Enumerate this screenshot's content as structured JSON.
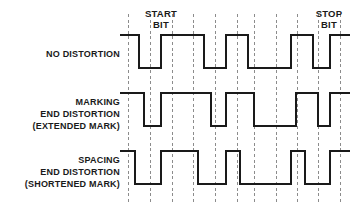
{
  "figure": {
    "background_color": "#ffffff",
    "trace_color": "#1a1a1a",
    "gridline_color": "#8c8c8c",
    "text_color": "#1a1a1a",
    "trace_width": 2.6,
    "width": 350,
    "height": 211
  },
  "annotations": {
    "start_bit": {
      "line1": "START",
      "line2": "BIT"
    },
    "stop_bit": {
      "line1": "STOP",
      "line2": "BIT"
    }
  },
  "rows": [
    {
      "id": "no-distortion",
      "labels": [
        "NO DISTORTION"
      ],
      "label_y": [
        57
      ]
    },
    {
      "id": "marking-end-distortion",
      "labels": [
        "MARKING",
        "END DISTORTION",
        "(EXTENDED MARK)"
      ],
      "label_y": [
        105,
        117,
        129
      ]
    },
    {
      "id": "spacing-end-distortion",
      "labels": [
        "SPACING",
        "END DISTORTION",
        "(SHORTENED MARK)"
      ],
      "label_y": [
        163,
        175,
        187
      ]
    }
  ],
  "chart_data": {
    "type": "line",
    "xlabel": "",
    "ylabel": "",
    "grid": true,
    "legend_position": "left",
    "x_axis": {
      "unit": "bit cell",
      "gridline_pixels": [
        128,
        150,
        172,
        193,
        215,
        237,
        254,
        276,
        297,
        318,
        340
      ],
      "plot_left_px": 128,
      "plot_right_px": 340,
      "bit_count": 10
    },
    "series": [
      {
        "name": "NO DISTORTION",
        "level_high_px": 35,
        "level_low_px": 68,
        "baseline_start_px": 120,
        "description": "Ideal waveform; all transitions fall exactly on bit boundaries.",
        "transitions_px": [
          {
            "x": 120,
            "level": "high"
          },
          {
            "x": 139,
            "level": "low"
          },
          {
            "x": 161,
            "level": "high"
          },
          {
            "x": 204,
            "level": "low"
          },
          {
            "x": 226,
            "level": "high"
          },
          {
            "x": 248,
            "level": "low"
          },
          {
            "x": 291,
            "level": "high"
          },
          {
            "x": 313,
            "level": "low"
          },
          {
            "x": 330,
            "level": "high"
          },
          {
            "x": 350,
            "level": "high"
          }
        ],
        "bits": [
          "1",
          "0",
          "1",
          "1",
          "0",
          "1",
          "0",
          "0",
          "1",
          "0",
          "1"
        ]
      },
      {
        "name": "MARKING END DISTORTION (EXTENDED MARK)",
        "level_high_px": 93,
        "level_low_px": 126,
        "baseline_start_px": 120,
        "description": "Mark (high) intervals are extended; falling edges occur late relative to the ideal bit boundary.",
        "transitions_px": [
          {
            "x": 120,
            "level": "high"
          },
          {
            "x": 144,
            "level": "low"
          },
          {
            "x": 161,
            "level": "high"
          },
          {
            "x": 211,
            "level": "low"
          },
          {
            "x": 226,
            "level": "high"
          },
          {
            "x": 254,
            "level": "low"
          },
          {
            "x": 296,
            "level": "high"
          },
          {
            "x": 318,
            "level": "low"
          },
          {
            "x": 330,
            "level": "high"
          },
          {
            "x": 350,
            "level": "high"
          }
        ]
      },
      {
        "name": "SPACING END DISTORTION (SHORTENED MARK)",
        "level_high_px": 151,
        "level_low_px": 184,
        "baseline_start_px": 120,
        "description": "Mark (high) intervals are shortened; falling edges occur early relative to the ideal bit boundary.",
        "transitions_px": [
          {
            "x": 120,
            "level": "high"
          },
          {
            "x": 135,
            "level": "low"
          },
          {
            "x": 161,
            "level": "high"
          },
          {
            "x": 198,
            "level": "low"
          },
          {
            "x": 226,
            "level": "high"
          },
          {
            "x": 240,
            "level": "low"
          },
          {
            "x": 291,
            "level": "high"
          },
          {
            "x": 305,
            "level": "low"
          },
          {
            "x": 330,
            "level": "high"
          },
          {
            "x": 350,
            "level": "high"
          }
        ]
      }
    ]
  }
}
